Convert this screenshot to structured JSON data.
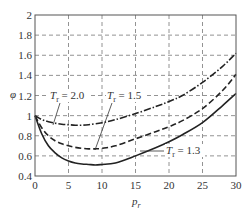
{
  "chart_data": {
    "type": "line",
    "title": "",
    "xlabel": "P_r",
    "ylabel": "φ",
    "xlim": [
      0,
      30
    ],
    "ylim": [
      0.4,
      2
    ],
    "x_ticks": [
      0,
      5,
      10,
      15,
      20,
      25,
      30
    ],
    "y_ticks": [
      0.4,
      0.6,
      0.8,
      1,
      1.2,
      1.4,
      1.6,
      1.8,
      2
    ],
    "y_tick_labels": [
      "0.4",
      "0.6",
      "0.8",
      "1",
      "1.2",
      "1.4",
      "1.6",
      "1.8",
      "2"
    ],
    "grid": true,
    "legend_position": "inline annotations",
    "series": [
      {
        "name": "T_r = 2.0",
        "style": "dash-dot",
        "x": [
          0,
          1,
          2,
          3,
          4,
          5,
          6,
          7,
          8,
          10,
          12,
          15,
          18,
          20,
          22,
          25,
          28,
          30
        ],
        "y": [
          1.0,
          0.96,
          0.94,
          0.925,
          0.915,
          0.91,
          0.905,
          0.905,
          0.91,
          0.93,
          0.96,
          1.02,
          1.09,
          1.14,
          1.2,
          1.33,
          1.49,
          1.62
        ]
      },
      {
        "name": "T_r = 1.5",
        "style": "dashed",
        "x": [
          0,
          1,
          2,
          3,
          4,
          5,
          6,
          7,
          8,
          9,
          10,
          12,
          15,
          18,
          20,
          22,
          25,
          28,
          30
        ],
        "y": [
          1.0,
          0.88,
          0.8,
          0.75,
          0.72,
          0.7,
          0.685,
          0.675,
          0.67,
          0.67,
          0.675,
          0.7,
          0.77,
          0.84,
          0.89,
          0.95,
          1.07,
          1.25,
          1.41
        ]
      },
      {
        "name": "T_r = 1.3",
        "style": "solid",
        "x": [
          0,
          1,
          2,
          3,
          4,
          5,
          6,
          7,
          8,
          9,
          10,
          12,
          15,
          18,
          20,
          22,
          25,
          28,
          30
        ],
        "y": [
          1.0,
          0.82,
          0.7,
          0.63,
          0.58,
          0.55,
          0.53,
          0.52,
          0.515,
          0.51,
          0.515,
          0.53,
          0.6,
          0.68,
          0.74,
          0.81,
          0.93,
          1.1,
          1.22
        ]
      }
    ],
    "annotations": [
      {
        "text_main": "T",
        "text_sub": "r",
        "text_rest": " = 2.0",
        "series": "T_r = 2.0"
      },
      {
        "text_main": "T",
        "text_sub": "r",
        "text_rest": " = 1.5",
        "series": "T_r = 1.5"
      },
      {
        "text_main": "T",
        "text_sub": "r",
        "text_rest": " = 1.3",
        "series": "T_r = 1.3"
      }
    ]
  },
  "axes": {
    "x_label_main": "p",
    "x_label_sub": "r",
    "y_label": "φ"
  }
}
